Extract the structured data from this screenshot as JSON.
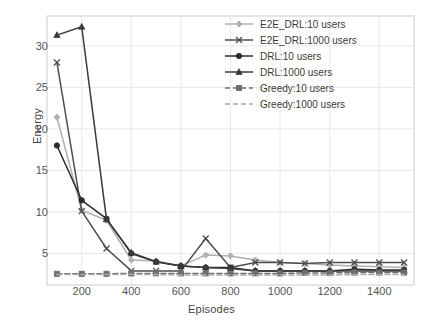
{
  "chart_data": {
    "type": "line",
    "title": "",
    "xlabel": "Episodes",
    "ylabel": "Energy",
    "xlim": [
      60,
      1540
    ],
    "ylim": [
      1.2,
      33.6
    ],
    "xticks": [
      200,
      400,
      600,
      800,
      1000,
      1200,
      1400
    ],
    "yticks": [
      5,
      10,
      15,
      20,
      25,
      30
    ],
    "grid": true,
    "legend_position": "upper right",
    "x": [
      100,
      200,
      300,
      400,
      500,
      600,
      700,
      800,
      900,
      1000,
      1100,
      1200,
      1300,
      1400,
      1500
    ],
    "series": [
      {
        "name": "E2E_DRL:10 users",
        "marker": "diamond",
        "linestyle": "solid",
        "color": "#b0b0b0",
        "values": [
          21.4,
          10.2,
          9.0,
          4.2,
          4.1,
          3.5,
          4.8,
          4.7,
          4.2,
          3.9,
          3.8,
          3.6,
          3.5,
          3.4,
          3.3
        ]
      },
      {
        "name": "E2E_DRL:1000 users",
        "marker": "x",
        "linestyle": "solid",
        "color": "#4d4d4d",
        "values": [
          28.0,
          10.1,
          5.6,
          2.9,
          2.9,
          2.9,
          6.8,
          3.3,
          3.9,
          3.9,
          3.8,
          3.9,
          3.9,
          3.9,
          3.9
        ]
      },
      {
        "name": "DRL:10 users",
        "marker": "circle",
        "linestyle": "solid",
        "color": "#2b2b2b",
        "values": [
          18.0,
          11.4,
          9.2,
          5.0,
          4.0,
          3.5,
          3.3,
          3.3,
          2.9,
          2.9,
          2.9,
          2.9,
          3.1,
          3.0,
          3.0
        ]
      },
      {
        "name": "DRL:1000 users",
        "marker": "triangle",
        "linestyle": "solid",
        "color": "#3a3a3a",
        "values": [
          31.3,
          32.3,
          9.1,
          5.1,
          4.0,
          3.5,
          3.3,
          3.2,
          2.9,
          2.9,
          2.9,
          2.9,
          2.9,
          2.9,
          2.9
        ]
      },
      {
        "name": "Greedy:10 users",
        "marker": "square",
        "linestyle": "dashed",
        "color": "#6e6e6e",
        "values": [
          2.55,
          2.55,
          2.55,
          2.6,
          2.6,
          2.6,
          2.6,
          2.6,
          2.6,
          2.6,
          2.65,
          2.65,
          2.7,
          2.7,
          2.7
        ]
      },
      {
        "name": "Greedy:1000 users",
        "marker": "none",
        "linestyle": "dashed",
        "color": "#adadad",
        "values": [
          2.45,
          2.45,
          2.45,
          2.5,
          2.45,
          2.4,
          2.4,
          2.4,
          2.4,
          2.4,
          2.4,
          2.4,
          2.45,
          2.45,
          2.45
        ]
      }
    ]
  },
  "style": {
    "plot_background": "#ffffff",
    "figure_background": "#ffffff",
    "grid_color": "#e8e8e8",
    "axis_border": "#cccccc",
    "tick_label_color": "#555555",
    "axis_label_color": "#444444"
  }
}
